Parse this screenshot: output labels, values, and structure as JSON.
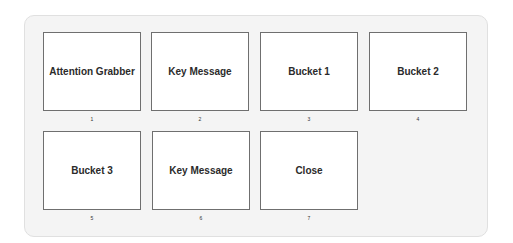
{
  "slides": [
    {
      "title": "Attention Grabber",
      "number": "1"
    },
    {
      "title": "Key Message",
      "number": "2"
    },
    {
      "title": "Bucket 1",
      "number": "3"
    },
    {
      "title": "Bucket 2",
      "number": "4"
    },
    {
      "title": "Bucket 3",
      "number": "5"
    },
    {
      "title": "Key Message",
      "number": "6"
    },
    {
      "title": "Close",
      "number": "7"
    }
  ]
}
